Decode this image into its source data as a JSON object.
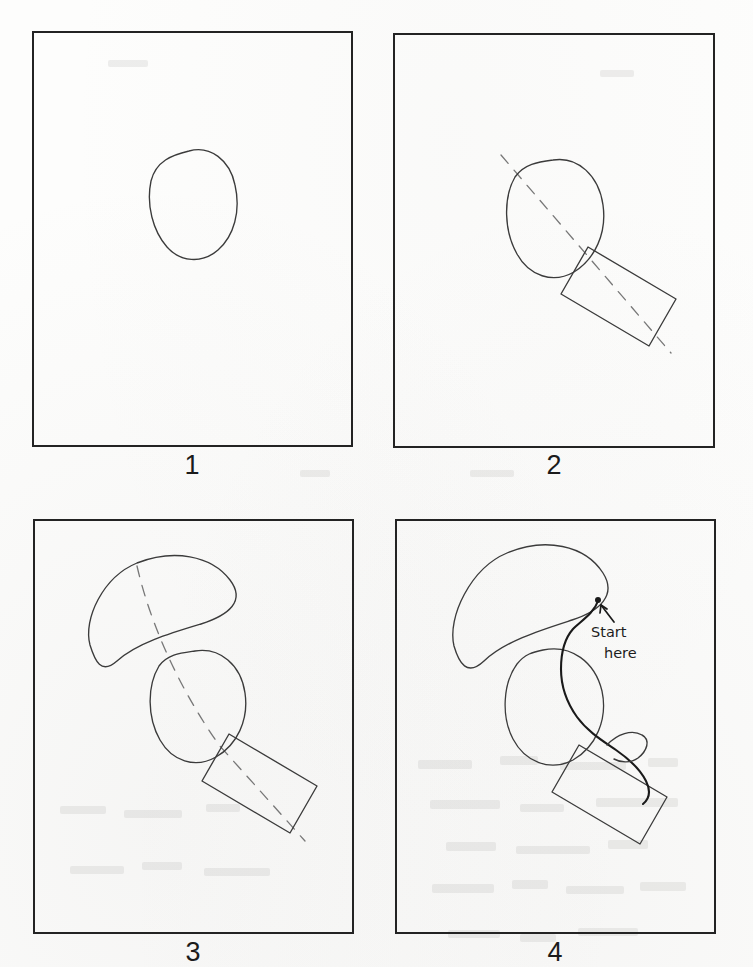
{
  "document": {
    "title": "Step-by-step mitten drawing tutorial",
    "page_background": "#fdfdfc",
    "ink_color": "#333333",
    "frame_color": "#232323",
    "guide_color": "#6e6e6e",
    "emphasis_color": "#1a1a1a"
  },
  "panels": [
    {
      "number": "1",
      "caption_label": "1",
      "description": "Tilted oval outlined in pencil, centred in the frame",
      "shapes": [
        "oval"
      ],
      "frame": {
        "x": 32,
        "y": 31,
        "w": 321,
        "h": 416
      },
      "label_pos": {
        "x": 192,
        "y": 452
      }
    },
    {
      "number": "2",
      "caption_label": "2",
      "description": "Same oval with a dashed centre guide line and a tilted rectangle added at the lower right",
      "shapes": [
        "oval",
        "dashed-guide-line",
        "rectangle"
      ],
      "frame": {
        "x": 393,
        "y": 33,
        "w": 322,
        "h": 415
      },
      "label_pos": {
        "x": 554,
        "y": 452
      }
    },
    {
      "number": "3",
      "caption_label": "3",
      "description": "Crescent / kidney shape added above the oval, dashed guide line extended through all three shapes",
      "shapes": [
        "crescent",
        "oval",
        "dashed-guide-line",
        "rectangle"
      ],
      "frame": {
        "x": 33,
        "y": 519,
        "w": 321,
        "h": 415
      },
      "label_pos": {
        "x": 193,
        "y": 939
      }
    },
    {
      "number": "4",
      "caption_label": "4",
      "description": "Guide lines removed; shapes joined into a single mitten outline with a thumb bump, annotated Start here",
      "shapes": [
        "crescent",
        "oval",
        "rectangle",
        "thumb-bump",
        "outline-stroke",
        "annotation-arrow"
      ],
      "frame": {
        "x": 395,
        "y": 519,
        "w": 321,
        "h": 415
      },
      "label_pos": {
        "x": 555,
        "y": 939
      }
    }
  ],
  "annotation": {
    "line_1": "Start",
    "line_2": "here",
    "arrow": "up-left-arrow",
    "panel": "4",
    "x": 588,
    "y": 612
  },
  "ghost_text": {
    "note": "faint bleed-through text from the reverse of the page",
    "rows": [
      "… — …… —— …",
      "—… …— ………",
      "…—— … —…",
      "—— …… —"
    ]
  }
}
